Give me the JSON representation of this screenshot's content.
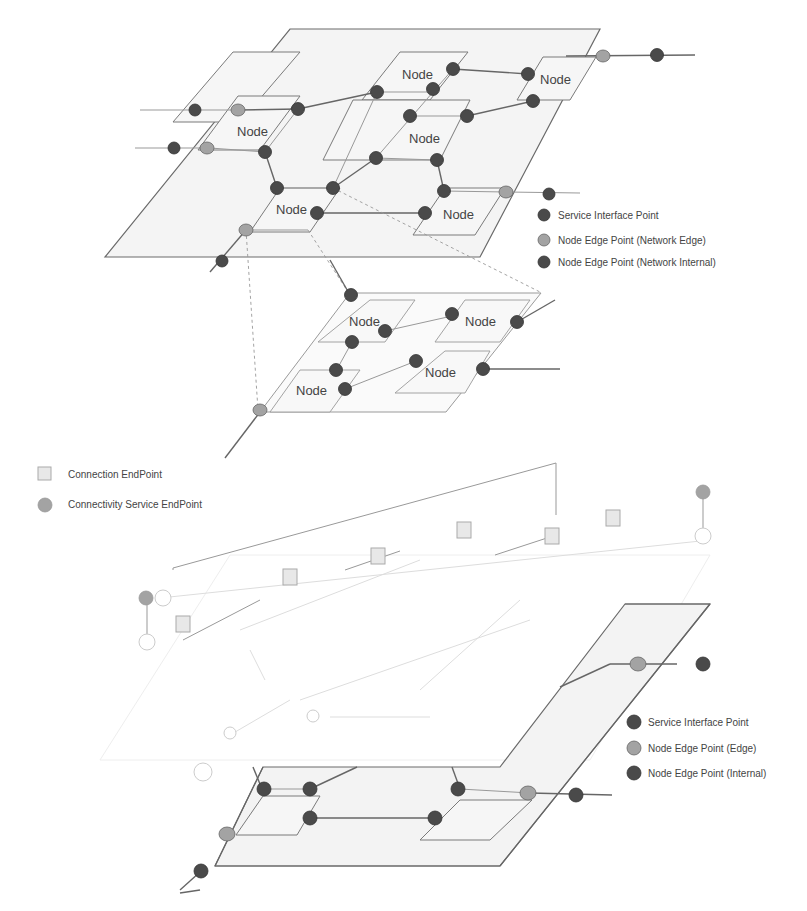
{
  "diagram": {
    "node_label": "Node",
    "top_layer": {
      "nodes": [
        "Node",
        "Node",
        "Node",
        "Node",
        "Node"
      ],
      "legend": [
        {
          "icon": "service-interface-point-icon",
          "color": "#4a4a4a",
          "label": "Service Interface Point"
        },
        {
          "icon": "node-edge-point-network-edge-icon",
          "color": "#a3a3a3",
          "label": "Node Edge Point (Network Edge)"
        },
        {
          "icon": "node-edge-point-network-internal-icon",
          "color": "#4a4a4a",
          "label": "Node Edge Point  (Network Internal)"
        }
      ]
    },
    "middle_layer": {
      "nodes": [
        "Node",
        "Node",
        "Node",
        "Node"
      ]
    },
    "connectivity_legend": [
      {
        "icon": "connection-endpoint-icon",
        "color": "#e8e8e8",
        "label": "Connection EndPoint"
      },
      {
        "icon": "connectivity-service-endpoint-icon",
        "color": "#a3a3a3",
        "label": "Connectivity Service EndPoint"
      }
    ],
    "bottom_layer": {
      "legend": [
        {
          "icon": "service-interface-point-icon",
          "color": "#4a4a4a",
          "label": "Service Interface Point"
        },
        {
          "icon": "node-edge-point-edge-icon",
          "color": "#a3a3a3",
          "label": "Node Edge Point (Edge)"
        },
        {
          "icon": "node-edge-point-internal-icon",
          "color": "#4a4a4a",
          "label": "Node Edge Point  (Internal)"
        }
      ]
    }
  }
}
